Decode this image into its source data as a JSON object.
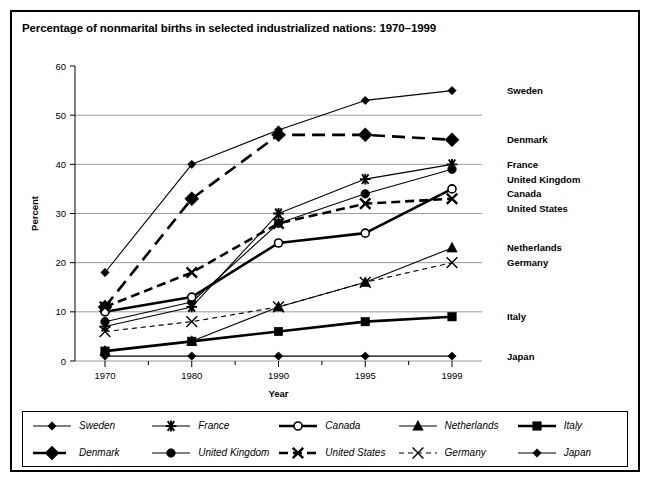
{
  "title": "Percentage of nonmarital births in selected industrialized nations: 1970–1999",
  "chart_data": {
    "type": "line",
    "title": "Percentage of nonmarital births in selected industrialized nations: 1970–1999",
    "xlabel": "Year",
    "ylabel": "Percent",
    "categories": [
      "1970",
      "1980",
      "1990",
      "1995",
      "1999"
    ],
    "ylim": [
      0,
      60
    ],
    "yticks": [
      0,
      10,
      20,
      30,
      40,
      50,
      60
    ],
    "grid": "horizontal",
    "legend_position": "bottom",
    "series": [
      {
        "name": "Sweden",
        "marker": "diamond-small",
        "line": "solid",
        "width": "thin",
        "values": [
          18,
          40,
          47,
          53,
          55
        ]
      },
      {
        "name": "Denmark",
        "marker": "diamond-large",
        "line": "dashed-long",
        "width": "thick",
        "values": [
          11,
          33,
          46,
          46,
          45
        ]
      },
      {
        "name": "France",
        "marker": "asterisk",
        "line": "solid",
        "width": "thin",
        "values": [
          7,
          11,
          30,
          37,
          40
        ]
      },
      {
        "name": "United Kingdom",
        "marker": "circle-filled",
        "line": "solid",
        "width": "thin",
        "values": [
          8,
          12,
          28,
          34,
          39
        ]
      },
      {
        "name": "Canada",
        "marker": "circle-open",
        "line": "solid",
        "width": "thick",
        "values": [
          10,
          13,
          24,
          26,
          35
        ]
      },
      {
        "name": "United States",
        "marker": "x-bold",
        "line": "dashed",
        "width": "thick",
        "values": [
          11,
          18,
          28,
          32,
          33
        ]
      },
      {
        "name": "Netherlands",
        "marker": "triangle",
        "line": "solid",
        "width": "thin",
        "values": [
          2,
          4,
          11,
          16,
          23
        ]
      },
      {
        "name": "Germany",
        "marker": "x-thin",
        "line": "dotted",
        "width": "thin",
        "values": [
          6,
          8,
          11,
          16,
          20
        ]
      },
      {
        "name": "Italy",
        "marker": "square",
        "line": "solid",
        "width": "thick",
        "values": [
          2,
          4,
          6,
          8,
          9
        ]
      },
      {
        "name": "Japan",
        "marker": "diamond-small",
        "line": "solid",
        "width": "thin",
        "values": [
          1,
          1,
          1,
          1,
          1
        ]
      }
    ]
  },
  "right_labels": [
    {
      "text": "Sweden",
      "value": 55
    },
    {
      "text": "Denmark",
      "value": 45
    },
    {
      "text": "France",
      "value": 40
    },
    {
      "text": "United Kingdom",
      "value": 37
    },
    {
      "text": "Canada",
      "value": 34
    },
    {
      "text": "United States",
      "value": 31
    },
    {
      "text": "Netherlands",
      "value": 23
    },
    {
      "text": "Germany",
      "value": 20
    },
    {
      "text": "Italy",
      "value": 9
    },
    {
      "text": "Japan",
      "value": 1
    }
  ],
  "legend": {
    "entries": [
      {
        "label": "Sweden",
        "marker": "diamond-small",
        "line": "solid",
        "width": "thin"
      },
      {
        "label": "Denmark",
        "marker": "diamond-large",
        "line": "dashed-long",
        "width": "thick"
      },
      {
        "label": "France",
        "marker": "asterisk",
        "line": "solid",
        "width": "thin"
      },
      {
        "label": "United Kingdom",
        "marker": "circle-filled",
        "line": "solid",
        "width": "thin"
      },
      {
        "label": "Canada",
        "marker": "circle-open",
        "line": "solid",
        "width": "thick"
      },
      {
        "label": "United States",
        "marker": "x-bold",
        "line": "dashed",
        "width": "thick"
      },
      {
        "label": "Netherlands",
        "marker": "triangle",
        "line": "solid",
        "width": "thin"
      },
      {
        "label": "Germany",
        "marker": "x-thin",
        "line": "dotted",
        "width": "thin"
      },
      {
        "label": "Italy",
        "marker": "square",
        "line": "solid",
        "width": "thick"
      },
      {
        "label": "Japan",
        "marker": "diamond-small",
        "line": "solid",
        "width": "thin"
      }
    ],
    "order": [
      0,
      2,
      4,
      6,
      8,
      1,
      3,
      5,
      7,
      9
    ]
  },
  "colors": {
    "ink": "#000000",
    "grid": "#9a9a9a",
    "frame": "#000000",
    "background": "#ffffff"
  }
}
